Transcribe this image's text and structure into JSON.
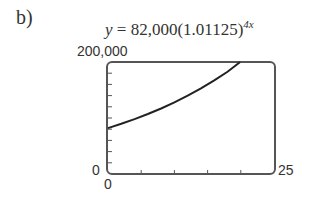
{
  "part_label": "b)",
  "formula": {
    "lhs": "y",
    "eq": " = 82,000(1.01125)",
    "exponent": "4x"
  },
  "window": {
    "ymax_label": "200,000",
    "ymin_label": "0",
    "xmin_label": "0",
    "xmax_label": "25"
  },
  "colors": {
    "frame": "#555555",
    "curve": "#222222",
    "text": "#333333"
  },
  "chart_data": {
    "type": "line",
    "xlabel": "",
    "ylabel": "",
    "xlim": [
      0,
      25
    ],
    "ylim": [
      0,
      200000
    ],
    "x_tick_step": 5,
    "y_tick_step": 20000,
    "grid": false,
    "legend": null,
    "series": [
      {
        "name": "y = 82,000(1.01125)^(4x)",
        "x": [
          0,
          2,
          4,
          6,
          8,
          10,
          12,
          14,
          16,
          18,
          19.9
        ],
        "values": [
          82000,
          89629,
          97967,
          107081,
          117043,
          127932,
          139834,
          152843,
          167063,
          182605,
          200000
        ]
      }
    ]
  }
}
